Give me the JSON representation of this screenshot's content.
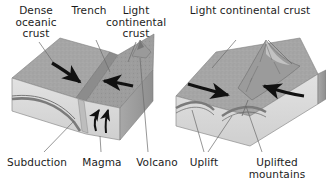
{
  "figure": {
    "type": "diagram",
    "background_color": "#ffffff",
    "text_color": "#1c1c1c",
    "panels": [
      {
        "id": "oceanic-continental-subduction",
        "labels": [
          {
            "id": "dense-oceanic-crust",
            "text": "Dense\noceanic\ncrust",
            "x": 36,
            "y": 5,
            "leader": true
          },
          {
            "id": "trench",
            "text": "Trench",
            "x": 89,
            "y": 5,
            "leader": true
          },
          {
            "id": "light-continental-crust",
            "text": "Light\ncontinental\ncrust",
            "x": 136,
            "y": 5,
            "leader": true
          },
          {
            "id": "subduction",
            "text": "Subduction",
            "x": 36,
            "y": 157,
            "leader": true
          },
          {
            "id": "magma",
            "text": "Magma",
            "x": 102,
            "y": 157,
            "leader": true
          },
          {
            "id": "volcano",
            "text": "Volcano",
            "x": 147,
            "y": 157,
            "leader": true
          }
        ]
      },
      {
        "id": "continental-collision-uplift",
        "labels": [
          {
            "id": "light-continental-crust-right",
            "text": "Light continental crust",
            "x": 249,
            "y": 5,
            "leader": true
          },
          {
            "id": "uplift",
            "text": "Uplift",
            "x": 204,
            "y": 157,
            "leader": true
          },
          {
            "id": "uplifted-mountains",
            "text": "Uplifted mountains",
            "x": 270,
            "y": 157,
            "leader": true
          }
        ]
      }
    ],
    "palette": {
      "crust_top": "#a6a6a6",
      "crust_top_dark": "#8f8f8f",
      "front_face": "#d9d9d9",
      "side_face": "#9c9c9c",
      "mantle_band": "#8a8a8a",
      "arrow": "#111111",
      "leader_line": "#6a6a6a"
    }
  }
}
